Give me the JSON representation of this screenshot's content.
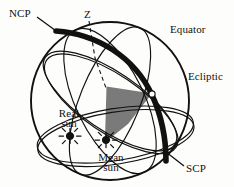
{
  "figure": {
    "background_color": "#fdfdfb",
    "stroke_color": "#111111",
    "shade_color": "#7a7a7a"
  },
  "labels": {
    "ncp": "NCP",
    "scp": "SCP",
    "zenith": "Z",
    "equator": "Equator",
    "ecliptic": "Ecliptic",
    "real_sun_line1": "Real",
    "real_sun_line2": "sun",
    "mean_sun_line1": "Mean",
    "mean_sun_line2": "sun"
  },
  "markers": {
    "real_sun_symbol": "sun-symbol",
    "mean_sun_symbol": "sun-symbol",
    "node_symbol": "intersection-node"
  },
  "geometry": {
    "sphere_center_x": 110,
    "sphere_center_y": 101,
    "sphere_radius": 79,
    "ncp_point_x": 58,
    "ncp_point_y": 31,
    "scp_point_x": 166,
    "scp_point_y": 161,
    "real_sun_x": 70,
    "real_sun_y": 136,
    "mean_sun_x": 106,
    "mean_sun_y": 140,
    "node_x": 152,
    "node_y": 95
  }
}
